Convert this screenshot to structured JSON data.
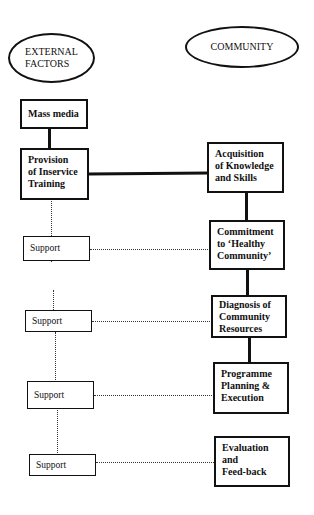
{
  "headers": {
    "left": "EXTERNAL\nFACTORS",
    "right": "COMMUNITY"
  },
  "external_factors": [
    {
      "id": "mass-media",
      "label": "Mass media"
    },
    {
      "id": "inservice-training",
      "label": "Provision\nof Inservice\nTraining"
    },
    {
      "id": "support-1",
      "label": "Support"
    },
    {
      "id": "support-2",
      "label": "Support"
    },
    {
      "id": "support-3",
      "label": "Support"
    },
    {
      "id": "support-4",
      "label": "Support"
    }
  ],
  "community_steps": [
    {
      "id": "acquisition",
      "label": "Acquisition\nof Knowledge\nand Skills"
    },
    {
      "id": "commitment",
      "label": "Commitment\nto ‘Healthy\nCommunity’"
    },
    {
      "id": "diagnosis",
      "label": "Diagnosis of\nCommunity\nResources"
    },
    {
      "id": "planning",
      "label": "Programme\nPlanning &\nExecution"
    },
    {
      "id": "evaluation",
      "label": "Evaluation\nand\nFeed-back"
    }
  ],
  "connections": {
    "solid": [
      [
        "mass-media",
        "inservice-training"
      ],
      [
        "inservice-training",
        "acquisition"
      ],
      [
        "acquisition",
        "commitment"
      ],
      [
        "commitment",
        "diagnosis"
      ],
      [
        "diagnosis",
        "planning"
      ]
    ],
    "dotted": [
      [
        "inservice-training",
        "support-1"
      ],
      [
        "support-1",
        "support-2"
      ],
      [
        "support-2",
        "support-3"
      ],
      [
        "support-3",
        "support-4"
      ],
      [
        "support-1",
        "commitment"
      ],
      [
        "support-2",
        "diagnosis"
      ],
      [
        "support-3",
        "planning"
      ],
      [
        "support-4",
        "evaluation"
      ]
    ]
  }
}
